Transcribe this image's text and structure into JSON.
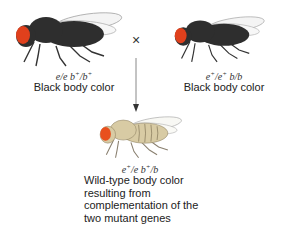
{
  "top_partial_text": "",
  "parents": [
    {
      "genotype_html": "e/e b+/b+",
      "phenotype": "Black body color",
      "body_color": "#2e2e2e",
      "eye_color": "#e0401c"
    },
    {
      "genotype_html": "e+/e+ b/b",
      "phenotype": "Black body color",
      "body_color": "#2e2e2e",
      "eye_color": "#e0401c"
    }
  ],
  "cross_symbol": "×",
  "offspring": {
    "genotype_html": "e+/e b+/b",
    "description_lines": [
      "Wild-type body color",
      "resulting from",
      "complementation of the",
      "two mutant genes"
    ],
    "body_color": "#d8cba4",
    "eye_color": "#e8501e"
  }
}
